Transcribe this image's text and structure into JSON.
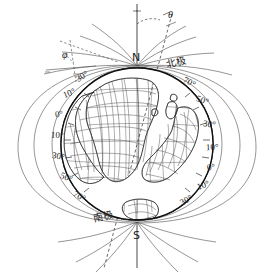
{
  "figure": {
    "background_color": "#ffffff",
    "line_color": "#222222",
    "globe": {
      "cx": 137,
      "cy": 144,
      "r": 77
    }
  },
  "axis": {
    "north_label": "N",
    "south_label": "S",
    "rotation_axis_name": "rotation-axis"
  },
  "angles": [
    {
      "name": "theta",
      "symbol": "θ",
      "x": 168,
      "y": 10
    },
    {
      "name": "phi",
      "symbol": "φ",
      "x": 62,
      "y": 57
    }
  ],
  "pole_labels": [
    {
      "name": "north-pole-cn",
      "text": "北极",
      "x": 166,
      "y": 60
    },
    {
      "name": "south-pole-cn",
      "text": "南极",
      "x": 93,
      "y": 213
    }
  ],
  "degree_labels_left": [
    {
      "text": "30°",
      "x": 76,
      "y": 75
    },
    {
      "text": "10°",
      "x": 63,
      "y": 91
    },
    {
      "text": "0°",
      "x": 54,
      "y": 112
    },
    {
      "text": "10°",
      "x": 51,
      "y": 134
    },
    {
      "text": "30°",
      "x": 52,
      "y": 155
    },
    {
      "text": "50°",
      "x": 60,
      "y": 177
    },
    {
      "text": "70°",
      "x": 73,
      "y": 196
    }
  ],
  "degree_labels_right": [
    {
      "text": "70°",
      "x": 185,
      "y": 81
    },
    {
      "text": "50°",
      "x": 199,
      "y": 100
    },
    {
      "text": "30°",
      "x": 205,
      "y": 126
    },
    {
      "text": "10°",
      "x": 208,
      "y": 148
    },
    {
      "text": "0°",
      "x": 208,
      "y": 167
    },
    {
      "text": "10°",
      "x": 199,
      "y": 185
    },
    {
      "text": "30°",
      "x": 182,
      "y": 199
    }
  ],
  "landmasses": [
    {
      "name": "africa"
    },
    {
      "name": "south-america"
    },
    {
      "name": "australia"
    },
    {
      "name": "madagascar"
    },
    {
      "name": "small-island-a"
    },
    {
      "name": "small-island-b"
    },
    {
      "name": "antarctica-edge"
    }
  ],
  "field_lines": {
    "name": "magnetic-field-lines",
    "count": 10
  }
}
